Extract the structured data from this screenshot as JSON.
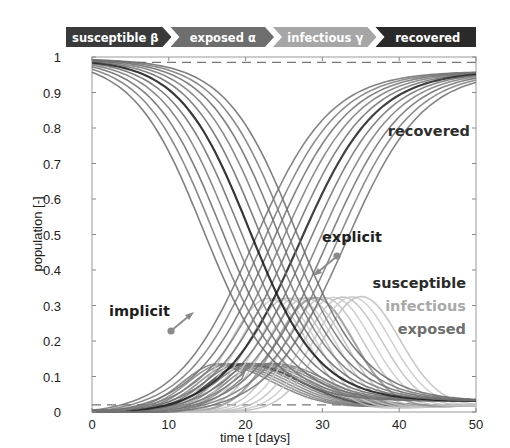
{
  "banner": {
    "stages": [
      {
        "label": "susceptible",
        "symbol": "β",
        "color": "#3a3a3a"
      },
      {
        "label": "exposed",
        "symbol": "α",
        "color": "#6e6e6e"
      },
      {
        "label": "infectious",
        "symbol": "γ",
        "color": "#a6a6a6"
      },
      {
        "label": "recovered",
        "symbol": "",
        "color": "#2a2a2a"
      }
    ]
  },
  "annotations": {
    "recovered": "recovered",
    "explicit": "explicit",
    "implicit": "implicit",
    "susceptible": "susceptible",
    "infectious": "infectious",
    "exposed": "exposed"
  },
  "colors": {
    "susceptible": "#2b2b2b",
    "recovered": "#333333",
    "infectious": "#b0b0b0",
    "exposed": "#7a7a7a",
    "dashed": "#777777",
    "marker": "#8a8a8a"
  },
  "chart_data": {
    "type": "line",
    "title": "",
    "xlabel": "time t [days]",
    "ylabel": "population [-]",
    "xlim": [
      0,
      50
    ],
    "ylim": [
      0,
      1
    ],
    "xticks": [
      0,
      10,
      20,
      30,
      40,
      50
    ],
    "yticks": [
      0,
      0.1,
      0.2,
      0.3,
      0.4,
      0.5,
      0.6,
      0.7,
      0.8,
      0.9,
      1
    ],
    "ytick_labels": [
      "0",
      "0.1",
      "0.2",
      "0.3",
      "0.4",
      "0.5",
      "0.6",
      "0.7",
      "0.8",
      "0.9",
      "1"
    ],
    "grid": false,
    "legend": "inline text annotations (right side)",
    "reference_lines": [
      {
        "style": "dashed",
        "y": 0.985
      },
      {
        "style": "dashed",
        "y": 0.02
      }
    ],
    "ensemble_size": 11,
    "ensemble_shift_days": [
      -6,
      -4.8,
      -3.6,
      -2.4,
      -1.2,
      0,
      1.2,
      2.4,
      3.6,
      4.8,
      6
    ],
    "series": [
      {
        "name": "susceptible",
        "description": "S-curve falling from ~0.99 to ~0.03",
        "x": [
          0,
          5,
          10,
          15,
          20,
          25,
          30,
          35,
          40,
          45,
          50
        ],
        "values": [
          0.99,
          0.97,
          0.9,
          0.72,
          0.45,
          0.22,
          0.1,
          0.05,
          0.035,
          0.03,
          0.03
        ]
      },
      {
        "name": "exposed",
        "description": "small hump peaking ~0.14 near t=20",
        "x": [
          0,
          5,
          10,
          15,
          20,
          25,
          30,
          35,
          40,
          45,
          50
        ],
        "values": [
          0.01,
          0.02,
          0.06,
          0.11,
          0.14,
          0.12,
          0.08,
          0.05,
          0.03,
          0.02,
          0.015
        ]
      },
      {
        "name": "infectious",
        "description": "hump peaking ~0.32 near t=29",
        "x": [
          0,
          5,
          10,
          15,
          20,
          25,
          30,
          35,
          40,
          45,
          50
        ],
        "values": [
          0.0,
          0.01,
          0.04,
          0.1,
          0.2,
          0.29,
          0.32,
          0.24,
          0.13,
          0.06,
          0.03
        ]
      },
      {
        "name": "recovered",
        "description": "S-curve rising from ~0 to ~0.96",
        "x": [
          0,
          5,
          10,
          15,
          20,
          25,
          30,
          35,
          40,
          45,
          50
        ],
        "values": [
          0.0,
          0.0,
          0.01,
          0.06,
          0.2,
          0.4,
          0.6,
          0.76,
          0.86,
          0.93,
          0.96
        ]
      }
    ]
  }
}
